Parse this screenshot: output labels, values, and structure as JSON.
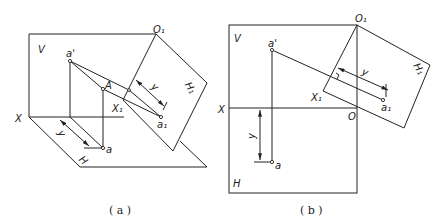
{
  "figures": [
    {
      "id": "a",
      "caption": "( a )",
      "labels": {
        "V": "V",
        "H": "H",
        "H1": "H₁",
        "X": "X",
        "X1": "X₁",
        "O1": "O₁",
        "a_prime": "a'",
        "A": "A",
        "a": "a",
        "a1": "a₁",
        "y_upper": "y",
        "y_lower": "y"
      }
    },
    {
      "id": "b",
      "caption": "( b )",
      "labels": {
        "V": "V",
        "H": "H",
        "H1": "H₁",
        "X": "X",
        "X1": "X₁",
        "O": "O",
        "O1": "O₁",
        "a_prime": "a'",
        "a": "a",
        "a1": "a₁",
        "y_upper": "y",
        "y_left": "y"
      }
    }
  ]
}
